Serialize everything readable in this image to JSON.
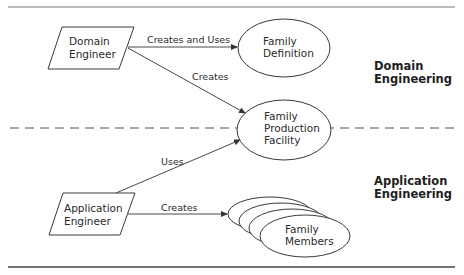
{
  "diagram": {
    "actors": [
      {
        "id": "domain-engineer",
        "lines": [
          "Domain",
          "Engineer"
        ]
      },
      {
        "id": "application-engineer",
        "lines": [
          "Application",
          "Engineer"
        ]
      }
    ],
    "artifacts": [
      {
        "id": "family-definition",
        "lines": [
          "Family",
          "Definition"
        ]
      },
      {
        "id": "family-production-facility",
        "lines": [
          "Family",
          "Production",
          "Facility"
        ]
      },
      {
        "id": "family-members",
        "lines": [
          "Family",
          "Members"
        ]
      }
    ],
    "edges": [
      {
        "from": "domain-engineer",
        "to": "family-definition",
        "label": "Creates and Uses"
      },
      {
        "from": "domain-engineer",
        "to": "family-production-facility",
        "label": "Creates"
      },
      {
        "from": "application-engineer",
        "to": "family-production-facility",
        "label": "Uses"
      },
      {
        "from": "application-engineer",
        "to": "family-members",
        "label": "Creates"
      }
    ],
    "regions": [
      {
        "id": "domain-engineering",
        "lines": [
          "Domain",
          "Engineering"
        ]
      },
      {
        "id": "application-engineering",
        "lines": [
          "Application",
          "Engineering"
        ]
      }
    ],
    "colors": {
      "stroke": "#3a3a3a",
      "text": "#2a2a2a",
      "background": "#ffffff"
    }
  }
}
